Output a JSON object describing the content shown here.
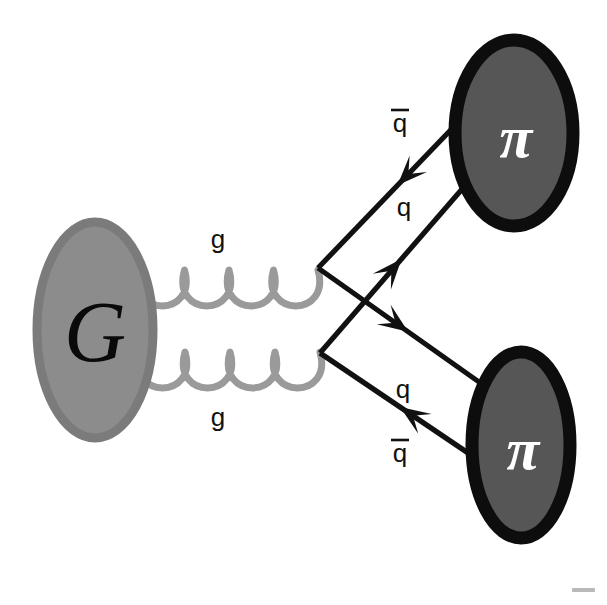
{
  "figure": {
    "type": "feynman-diagram",
    "background_color": "#ffffff",
    "width": 607,
    "height": 605
  },
  "colors": {
    "glueball_fill": "#8c8c8c",
    "glueball_edge": "#7b7b7b",
    "glueball_letter": "#0a0a0a",
    "pion_fill": "#565656",
    "pion_edge": "#0d0d0d",
    "pion_letter": "#ffffff",
    "gluon_stroke": "#9a9a9a",
    "fermion_stroke": "#111111",
    "label_color": "#111111"
  },
  "blobs": {
    "glueball": {
      "name": "glueball",
      "label": "G",
      "cx": 95,
      "cy": 330,
      "rx": 58,
      "ry": 108
    },
    "pion_top": {
      "name": "pion-top",
      "label": "π",
      "cx": 514,
      "cy": 133,
      "rx": 59,
      "ry": 93
    },
    "pion_bottom": {
      "name": "pion-bottom",
      "label": "π",
      "cx": 521,
      "cy": 445,
      "rx": 49,
      "ry": 93
    }
  },
  "gluons": [
    {
      "name": "gluon-upper",
      "label": "g",
      "label_position": "above",
      "label_x": 218,
      "label_y": 248,
      "x_start": 140,
      "x_end": 318,
      "y_axis": 270,
      "loops": 4,
      "loop_depth": 52
    },
    {
      "name": "gluon-lower",
      "label": "g",
      "label_position": "below",
      "label_x": 218,
      "label_y": 426,
      "x_start": 140,
      "x_end": 320,
      "y_axis": 352,
      "loops": 4,
      "loop_depth": 52
    }
  ],
  "vertices": [
    {
      "name": "vertex-upper",
      "x": 318,
      "y": 268
    },
    {
      "name": "vertex-lower",
      "x": 320,
      "y": 353
    }
  ],
  "fermion_lines": [
    {
      "name": "antiquark-upper-to-top-pion",
      "label": "q",
      "has_overbar": true,
      "label_x": 400,
      "label_y": 132,
      "from": {
        "x": 318,
        "y": 268
      },
      "to": {
        "x": 468,
        "y": 112
      },
      "arrow_direction": "toward-vertex",
      "arrow_t": 0.53
    },
    {
      "name": "quark-lower-to-top-pion",
      "label": "q",
      "has_overbar": false,
      "label_x": 404,
      "label_y": 216,
      "from": {
        "x": 320,
        "y": 353
      },
      "to": {
        "x": 463,
        "y": 188
      },
      "arrow_direction": "toward-pion",
      "arrow_t": 0.57
    },
    {
      "name": "quark-upper-to-bottom-pion",
      "label": "q",
      "has_overbar": false,
      "label_x": 403,
      "label_y": 398,
      "from": {
        "x": 318,
        "y": 268
      },
      "to": {
        "x": 479,
        "y": 382
      },
      "arrow_direction": "toward-pion",
      "arrow_t": 0.56
    },
    {
      "name": "antiquark-lower-to-bottom-pion",
      "label": "q",
      "has_overbar": true,
      "label_x": 400,
      "label_y": 462,
      "from": {
        "x": 320,
        "y": 353
      },
      "to": {
        "x": 474,
        "y": 457
      },
      "arrow_direction": "toward-vertex",
      "arrow_t": 0.52
    }
  ]
}
